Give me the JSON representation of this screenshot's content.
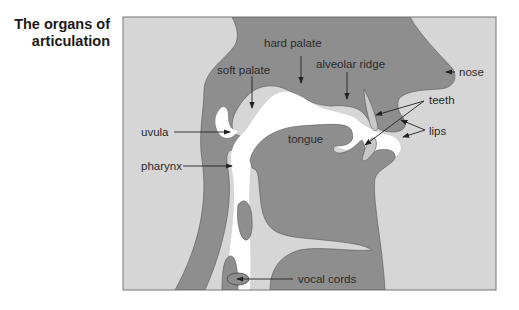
{
  "title": {
    "line1": "The organs of",
    "line2": "articulation"
  },
  "labels": {
    "hard_palate": "hard palate",
    "soft_palate": "soft palate",
    "alveolar_ridge": "alveolar ridge",
    "nose": "nose",
    "teeth": "teeth",
    "uvula": "uvula",
    "tongue": "tongue",
    "lips": "lips",
    "pharynx": "pharynx",
    "vocal_cords": "vocal cords"
  },
  "colors": {
    "background_region": "#d6d6d6",
    "tissue": "#8e8e8e",
    "teeth": "#c8c8c8",
    "airway": "#ffffff",
    "frame": "#777777",
    "text": "#2a2a2a"
  }
}
